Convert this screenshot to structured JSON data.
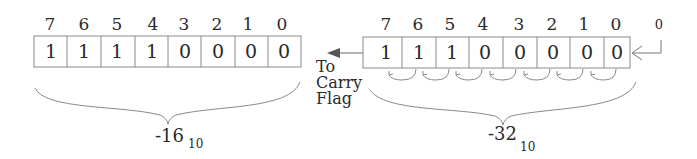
{
  "before": {
    "bit_positions": [
      "7",
      "6",
      "5",
      "4",
      "3",
      "2",
      "1",
      "0"
    ],
    "bits": [
      "1",
      "1",
      "1",
      "1",
      "0",
      "0",
      "0",
      "0"
    ],
    "value": "-16",
    "base": "10"
  },
  "after": {
    "bit_positions": [
      "7",
      "6",
      "5",
      "4",
      "3",
      "2",
      "1",
      "0"
    ],
    "bits": [
      "1",
      "1",
      "1",
      "0",
      "0",
      "0",
      "0",
      "0"
    ],
    "value": "-32",
    "base": "10",
    "shift_in_bit": "0"
  },
  "carry_label": [
    "To",
    "Carry",
    "Flag"
  ],
  "colors": {
    "line": "#8a8a8a",
    "text": "#2a2a2a",
    "arrow": "#555555"
  }
}
